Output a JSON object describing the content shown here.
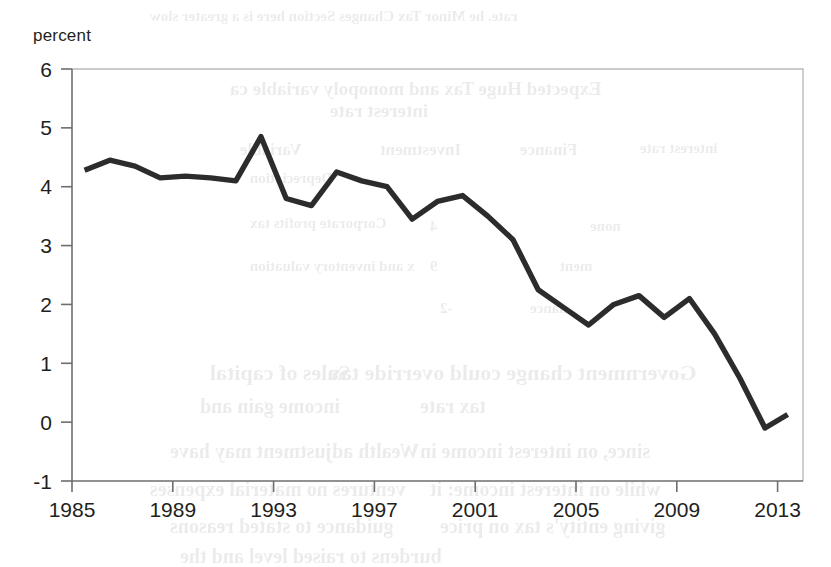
{
  "chart_data": {
    "type": "line",
    "title": "",
    "subtitle": "",
    "xlabel": "",
    "ylabel": "percent",
    "ylim": [
      -1,
      6
    ],
    "xlim": [
      1985,
      2013.7
    ],
    "grid": false,
    "legend_position": "none",
    "y_ticks": [
      6,
      5,
      4,
      3,
      2,
      1,
      0,
      -1
    ],
    "y_tick_labels": [
      "6",
      "5",
      "4",
      "3",
      "2",
      "1",
      "0",
      "-1"
    ],
    "x_ticks": [
      1985,
      1989,
      1993,
      1997,
      2001,
      2005,
      2009,
      2013
    ],
    "x_tick_labels": [
      "1985",
      "1989",
      "1993",
      "1997",
      "2001",
      "2005",
      "2009",
      "2013"
    ],
    "series": [
      {
        "name": "percent",
        "color": "#2c2c2c",
        "x": [
          1985.5,
          1986.5,
          1987.5,
          1988.5,
          1989.5,
          1990.5,
          1991.5,
          1992.5,
          1993.5,
          1994.5,
          1995.5,
          1996.5,
          1997.5,
          1998.5,
          1999.5,
          2000.5,
          2001.5,
          2002.5,
          2003.5,
          2004.5,
          2005.5,
          2006.5,
          2007.5,
          2008.5,
          2009.5,
          2010.5,
          2011.5,
          2012.5,
          2013.4
        ],
        "values": [
          4.28,
          4.45,
          4.35,
          4.15,
          4.18,
          4.15,
          4.1,
          4.85,
          3.8,
          3.68,
          4.25,
          4.1,
          4.0,
          3.45,
          3.75,
          3.85,
          3.5,
          3.1,
          2.25,
          1.95,
          1.65,
          2.0,
          2.15,
          1.78,
          2.1,
          1.5,
          0.75,
          -0.1,
          0.13
        ]
      }
    ],
    "annotations": []
  },
  "bleed_through_text": [
    {
      "text": "rate. he Minor Tax Changes Section here is a greater slow",
      "x": 150,
      "y": 8,
      "size": 15
    },
    {
      "text": "Expected Huge Tax and monopoly variable ca",
      "x": 230,
      "y": 78,
      "size": 19
    },
    {
      "text": "interest rate",
      "x": 330,
      "y": 100,
      "size": 19
    },
    {
      "text": "Variable",
      "x": 240,
      "y": 140,
      "size": 17
    },
    {
      "text": "Investment",
      "x": 380,
      "y": 140,
      "size": 17
    },
    {
      "text": "Finance",
      "x": 520,
      "y": 140,
      "size": 17
    },
    {
      "text": "interest rate",
      "x": 640,
      "y": 140,
      "size": 15
    },
    {
      "text": "Depreciation",
      "x": 250,
      "y": 170,
      "size": 15
    },
    {
      "text": "Corporate profits tax",
      "x": 250,
      "y": 215,
      "size": 15
    },
    {
      "text": "4",
      "x": 430,
      "y": 218,
      "size": 15
    },
    {
      "text": "none",
      "x": 590,
      "y": 218,
      "size": 15
    },
    {
      "text": "x and inventory valuation",
      "x": 250,
      "y": 258,
      "size": 15
    },
    {
      "text": "9",
      "x": 430,
      "y": 258,
      "size": 15
    },
    {
      "text": "ment",
      "x": 560,
      "y": 258,
      "size": 15
    },
    {
      "text": "-2",
      "x": 440,
      "y": 300,
      "size": 15
    },
    {
      "text": "nance",
      "x": 530,
      "y": 300,
      "size": 15
    },
    {
      "text": "Sales of capital",
      "x": 210,
      "y": 360,
      "size": 22
    },
    {
      "text": "Government change could override tax",
      "x": 330,
      "y": 360,
      "size": 22
    },
    {
      "text": "income gain and",
      "x": 200,
      "y": 395,
      "size": 20
    },
    {
      "text": "tax rate",
      "x": 420,
      "y": 395,
      "size": 20
    },
    {
      "text": "Wealth adjustment may have",
      "x": 170,
      "y": 440,
      "size": 20
    },
    {
      "text": "since, on interest income in",
      "x": 420,
      "y": 440,
      "size": 20
    },
    {
      "text": "ventures no material expenses",
      "x": 150,
      "y": 478,
      "size": 20
    },
    {
      "text": "while on interest income: it",
      "x": 430,
      "y": 478,
      "size": 20
    },
    {
      "text": "guidance to stated reasons",
      "x": 170,
      "y": 515,
      "size": 20
    },
    {
      "text": "giving entity's tax on price",
      "x": 440,
      "y": 515,
      "size": 20
    },
    {
      "text": "burdens to raised level and the",
      "x": 180,
      "y": 545,
      "size": 20
    }
  ]
}
